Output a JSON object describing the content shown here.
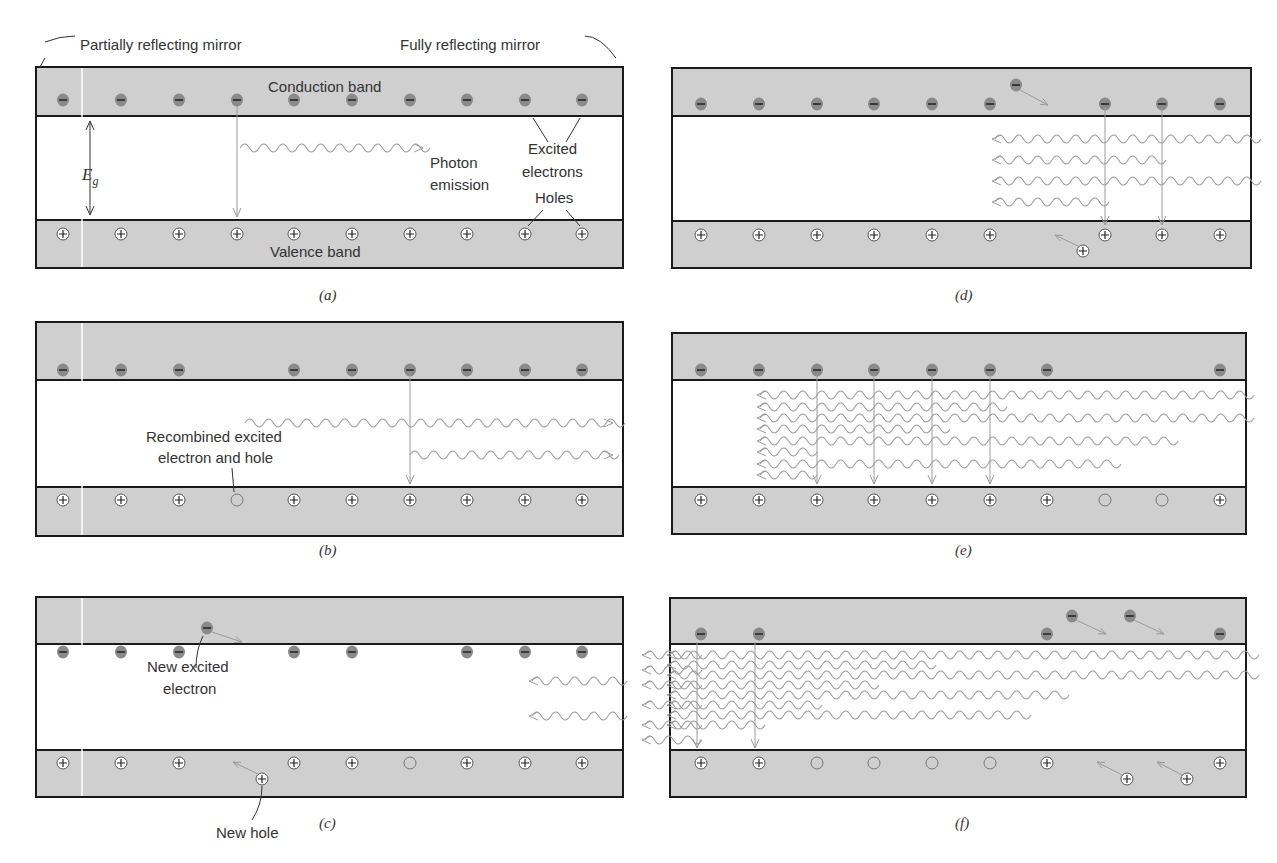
{
  "colors": {
    "band": "#cfcfcf",
    "border": "#1a1a1a",
    "electron": "#8a8a8a",
    "photon": "#9a9a9a",
    "text": "#333333"
  },
  "labels": {
    "partial_mirror": "Partially reflecting mirror",
    "full_mirror": "Fully reflecting mirror",
    "conduction_band": "Conduction band",
    "valence_band": "Valence band",
    "eg": "E",
    "eg_sub": "g",
    "excited1": "Excited",
    "excited2": "electrons",
    "photon1": "Photon",
    "photon2": "emission",
    "holes": "Holes",
    "recomb1": "Recombined excited",
    "recomb2": "electron and hole",
    "new_e1": "New excited",
    "new_e2": "electron",
    "new_hole": "New hole"
  },
  "captions": [
    "(a)",
    "(b)",
    "(c)",
    "(d)",
    "(e)",
    "(f)"
  ]
}
